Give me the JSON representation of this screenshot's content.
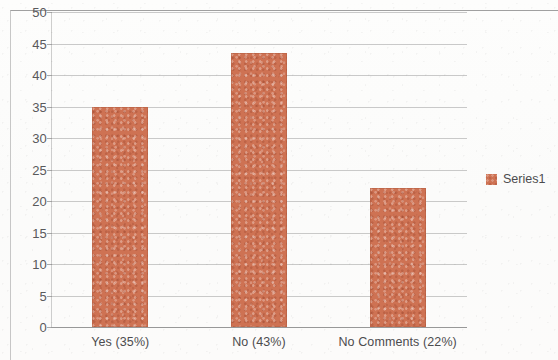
{
  "chart_data": {
    "type": "bar",
    "title": "",
    "subtitle": "",
    "xlabel": "",
    "ylabel": "",
    "categories": [
      "Yes (35%)",
      "No (43%)",
      "No Comments (22%)"
    ],
    "series": [
      {
        "name": "Series1",
        "color": "#ce7253",
        "values": [
          35,
          43.5,
          22
        ]
      }
    ],
    "ylim": [
      0,
      50
    ],
    "ytick_step": 5,
    "ytick_labels": [
      "0",
      "5",
      "10",
      "15",
      "20",
      "25",
      "30",
      "35",
      "40",
      "45",
      "50"
    ],
    "ytick_values": [
      0,
      5,
      10,
      15,
      20,
      25,
      30,
      35,
      40,
      45,
      50
    ],
    "grid": true,
    "grid_axis": "y",
    "grid_color": "#a9a9a9",
    "legend": {
      "position": "right",
      "entries": [
        {
          "label": "Series1",
          "color": "#ce7253"
        }
      ]
    },
    "axis_line_color": "#bdbdbd",
    "text_color": "#4c4c4e"
  }
}
